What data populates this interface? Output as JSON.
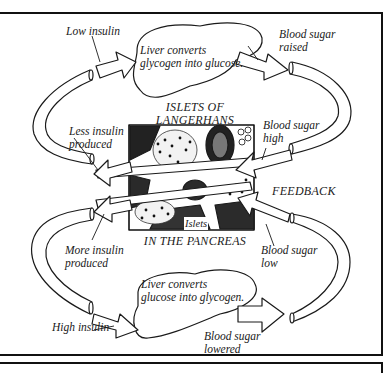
{
  "diagram": {
    "title_top": {
      "line1": "ISLETS OF",
      "line2": "LANGERHANS"
    },
    "title_bottom": "IN THE PANCREAS",
    "center_image_label": "Islets",
    "feedback_label": "FEEDBACK",
    "liver_top": {
      "line1": "Liver converts",
      "line2": "glycogen into glucose."
    },
    "liver_bottom": {
      "line1": "Liver converts",
      "line2": "glucose into glycogen."
    },
    "labels": {
      "low_insulin": "Low insulin",
      "high_insulin": "High insulin",
      "blood_sugar_raised": {
        "line1": "Blood sugar",
        "line2": "raised"
      },
      "blood_sugar_high": {
        "line1": "Blood sugar",
        "line2": "high"
      },
      "blood_sugar_low": {
        "line1": "Blood sugar",
        "line2": "low"
      },
      "blood_sugar_lowered": {
        "line1": "Blood sugar",
        "line2": "lowered"
      },
      "less_insulin_produced": {
        "line1": "Less insulin",
        "line2": "produced"
      },
      "more_insulin_produced": {
        "line1": "More insulin",
        "line2": "produced"
      }
    },
    "colors": {
      "ink": "#1a1a1a",
      "paper": "#ffffff"
    }
  }
}
